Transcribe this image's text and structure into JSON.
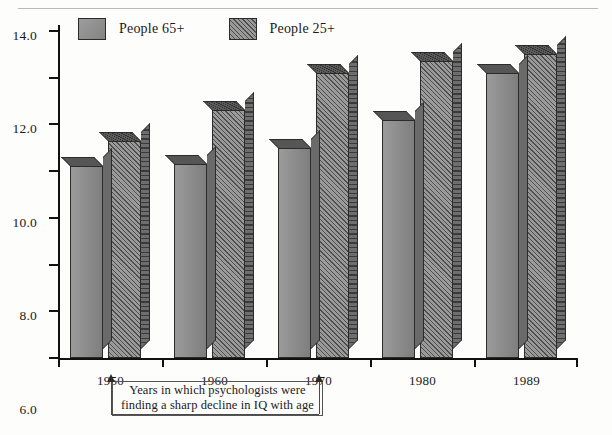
{
  "figure": {
    "top_rule": true,
    "background_color": "#fdfdfb"
  },
  "legend": {
    "position": "top-left-inside",
    "entries": [
      {
        "label": "People 65+",
        "swatch": "solid-gray-swatch",
        "color": "#8e8e8e"
      },
      {
        "label": "People 25+",
        "swatch": "hatched-gray-swatch",
        "color": "#9a9a9a"
      }
    ]
  },
  "axes": {
    "y_ticks": [
      "0.0",
      "2.0",
      "4.0",
      "6.0",
      "8.0",
      "10.0",
      "12.0",
      "14.0"
    ],
    "x_ticks": [
      "1950",
      "1960",
      "1970",
      "1980",
      "1989"
    ]
  },
  "annotation": {
    "line1": "Years in which psychologists were",
    "line2": "finding a sharp decline in IQ with age",
    "arrow_targets": [
      "1950",
      "1970"
    ],
    "arrow_icon": "up-arrow-icon"
  },
  "chart_data": {
    "type": "bar",
    "title": "",
    "subtitle": "",
    "xlabel": "",
    "ylabel": "",
    "ylim": [
      0,
      14
    ],
    "ytick_step": 2,
    "grid": false,
    "legend_position": "top-left",
    "style": "3d-bars",
    "categories": [
      "1950",
      "1960",
      "1970",
      "1980",
      "1989"
    ],
    "series": [
      {
        "name": "People 65+",
        "values": [
          8.2,
          8.3,
          9.0,
          10.2,
          12.2
        ]
      },
      {
        "name": "People 25+",
        "values": [
          9.3,
          10.6,
          12.2,
          12.7,
          13.0
        ]
      }
    ]
  }
}
